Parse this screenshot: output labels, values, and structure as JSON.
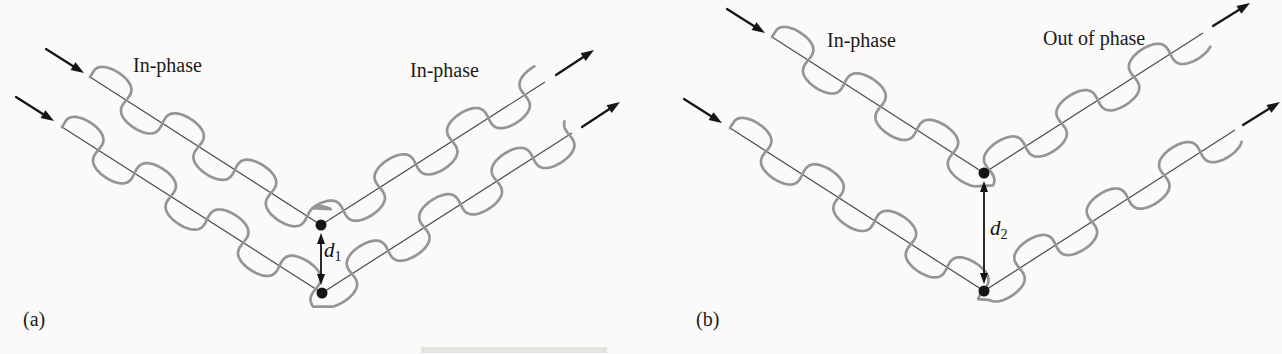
{
  "figure": {
    "background": "#fbfaf8",
    "wave_color": "#959595",
    "line_color": "#4f4f4f",
    "arrow_color": "#151515",
    "text_color": "#1a1a1a",
    "wave": {
      "amplitude": 19,
      "wavelength": 86,
      "loop": 8
    },
    "panels": [
      {
        "id": "a",
        "label": "(a)",
        "phase_left": "In-phase",
        "phase_right": "In-phase",
        "d_label": {
          "base": "d",
          "sub": "1"
        },
        "d_arrow": {
          "x": 321,
          "y1": 233,
          "y2": 285
        },
        "rays": [
          {
            "name": "upper",
            "start": [
              90,
              77
            ],
            "vertex": [
              321,
              225
            ],
            "end": [
              545,
              82
            ],
            "arrow_in": {
              "tail": [
                46,
                49
              ],
              "tip": [
                84,
                73
              ]
            },
            "arrow_out": {
              "tail": [
                556,
                75
              ],
              "tip": [
                594,
                50
              ]
            }
          },
          {
            "name": "lower",
            "start": [
              62,
              127
            ],
            "vertex": [
              322,
              293
            ],
            "end": [
              572,
              133
            ],
            "arrow_in": {
              "tail": [
                16,
                97
              ],
              "tip": [
                54,
                121
              ]
            },
            "arrow_out": {
              "tail": [
                582,
                127
              ],
              "tip": [
                620,
                102
              ]
            }
          }
        ]
      },
      {
        "id": "b",
        "label": "(b)",
        "phase_left": "In-phase",
        "phase_right": "Out of phase",
        "d_label": {
          "base": "d",
          "sub": "2"
        },
        "d_arrow": {
          "x": 984,
          "y1": 181,
          "y2": 284
        },
        "rays": [
          {
            "name": "upper",
            "start": [
              772,
              37
            ],
            "vertex": [
              984,
              173
            ],
            "end": [
              1203,
              33
            ],
            "arrow_in": {
              "tail": [
                727,
                9
              ],
              "tip": [
                765,
                33
              ]
            },
            "arrow_out": {
              "tail": [
                1213,
                26
              ],
              "tip": [
                1250,
                3
              ]
            }
          },
          {
            "name": "lower",
            "start": [
              730,
              128
            ],
            "vertex": [
              984,
              291
            ],
            "end": [
              1235,
              130
            ],
            "arrow_in": {
              "tail": [
                684,
                99
              ],
              "tip": [
                722,
                123
              ]
            },
            "arrow_out": {
              "tail": [
                1243,
                125
              ],
              "tip": [
                1280,
                102
              ]
            }
          }
        ]
      }
    ],
    "artifact_band": {
      "x": 421,
      "y": 347,
      "w": 186,
      "h": 6,
      "color": "#e0dfdc"
    }
  }
}
